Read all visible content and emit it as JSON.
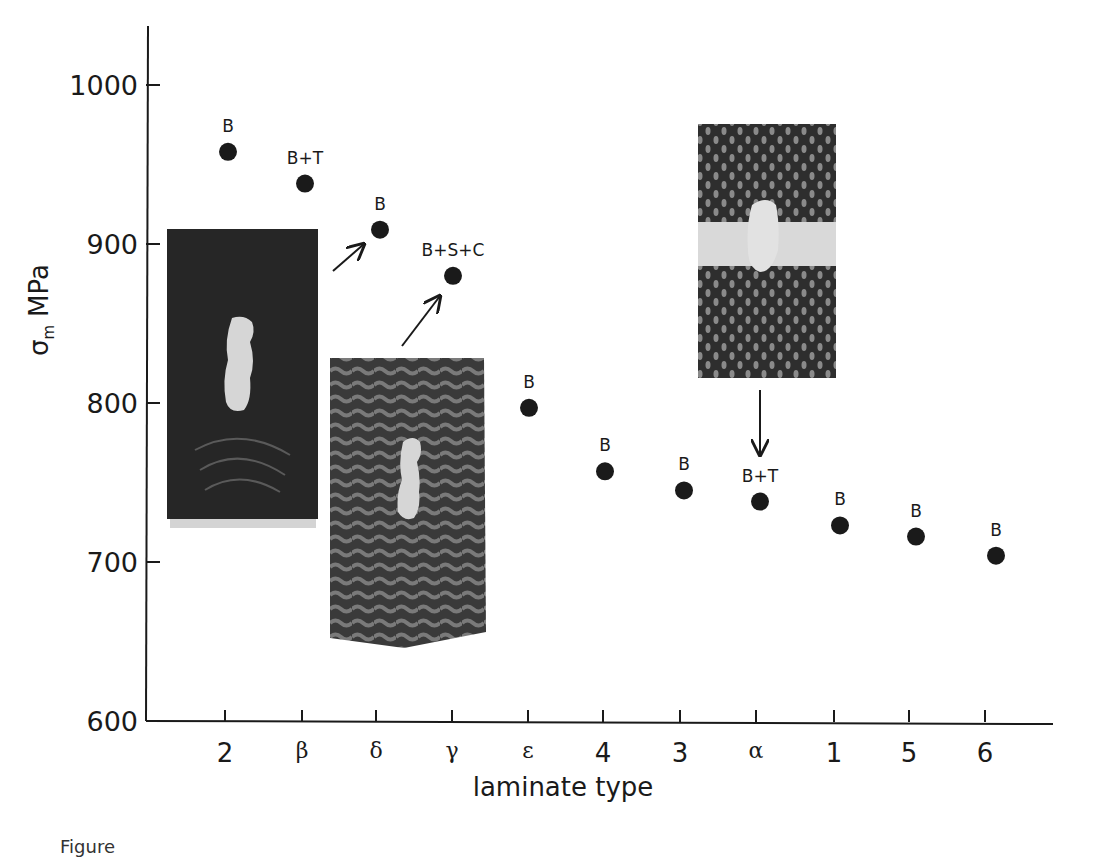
{
  "chart_data": {
    "type": "scatter",
    "title": "",
    "xlabel": "laminate type",
    "ylabel": "σm MPa",
    "ylabel_main": "σ",
    "ylabel_sub": "m",
    "ylabel_unit": "MPa",
    "ylim": [
      600,
      1040
    ],
    "yticks": [
      600,
      700,
      800,
      900,
      1000
    ],
    "grid": false,
    "legend": null,
    "categories": [
      "2",
      "β",
      "δ",
      "γ",
      "ε",
      "4",
      "3",
      "α",
      "1",
      "5",
      "6"
    ],
    "values": [
      958,
      938,
      909,
      880,
      797,
      757,
      745,
      738,
      723,
      716,
      704
    ],
    "point_labels": [
      "B",
      "B+T",
      "B",
      "B+S+C",
      "B",
      "B",
      "B",
      "B+T",
      "B",
      "B",
      "B"
    ],
    "annotations": [
      {
        "type": "inset-photo",
        "description": "fracture specimen micrograph, dark matrix with notch",
        "points_to": "δ"
      },
      {
        "type": "inset-photo",
        "description": "fracture specimen micrograph, woven texture with notch",
        "points_to": "γ"
      },
      {
        "type": "inset-photo",
        "description": "fracture specimen micrograph, dotted weave with transverse crack band",
        "points_to": "α"
      }
    ]
  },
  "caption_fragment": "Figure"
}
